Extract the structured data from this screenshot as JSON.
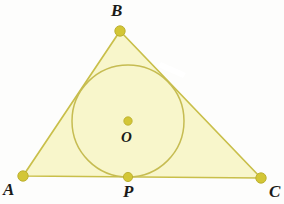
{
  "figure": {
    "kind": "geometry-diagram",
    "background_color": "#fdfdfc",
    "fill_color": "#f8f6cb",
    "stroke_color": "#c9bf4a",
    "circle_stroke_color": "#c6bc52",
    "point_color": "#d3c636",
    "point_edge_color": "#b9ad2c",
    "label_color": "#1a1a18",
    "labels": {
      "A": "A",
      "B": "B",
      "C": "C",
      "P": "P",
      "O": "O"
    },
    "points": {
      "A": {
        "x": 23,
        "y": 176,
        "r": 5.2
      },
      "B": {
        "x": 120,
        "y": 31,
        "r": 5.2
      },
      "C": {
        "x": 261,
        "y": 178,
        "r": 5.2
      },
      "P": {
        "x": 128,
        "y": 177,
        "r": 4.6
      },
      "O": {
        "x": 128,
        "y": 121,
        "r": 4.2
      }
    },
    "triangle": {
      "points_attr": "23,176 120,31 261,178",
      "stroke_width": 1.7
    },
    "incircle": {
      "cx": 128,
      "cy": 121,
      "r": 56,
      "stroke_width": 1.5
    },
    "artifact_notch": {
      "points_attr": "161,62 186,73 183,78 158,67",
      "color": "#ffffff"
    }
  }
}
